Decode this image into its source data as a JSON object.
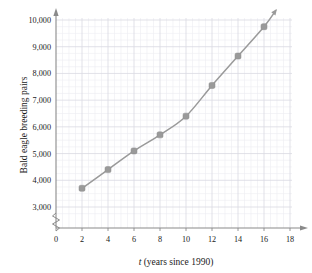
{
  "chart_data": {
    "type": "line",
    "title": "",
    "xlabel": "t (years since 1990)",
    "xlabel_italic_part": "t",
    "xlabel_rest": " (years since 1990)",
    "ylabel": "Bald eagle breeding pairs",
    "x": [
      2,
      4,
      6,
      8,
      10,
      12,
      14,
      16
    ],
    "values": [
      3700,
      4400,
      5100,
      5700,
      6400,
      7550,
      8650,
      9750
    ],
    "xlim": [
      0,
      18
    ],
    "ylim": [
      2600,
      10250
    ],
    "xticks": [
      0,
      2,
      4,
      6,
      8,
      10,
      12,
      14,
      16,
      18
    ],
    "xtick_labels": [
      "0",
      "2",
      "4",
      "6",
      "8",
      "10",
      "12",
      "14",
      "16",
      "18"
    ],
    "yticks": [
      3000,
      4000,
      5000,
      6000,
      7000,
      8000,
      9000,
      10000
    ],
    "ytick_labels": [
      "3,000",
      "4,000",
      "5,000",
      "6,000",
      "7,000",
      "8,000",
      "9,000",
      "10,000"
    ],
    "grid": true,
    "grid_minor": true,
    "y_axis_break": true,
    "legend": "none",
    "series_color": "#9a9a9a",
    "marker": "square-rounded",
    "marker_color": "#9a9a9a",
    "arrow_end": true,
    "axis_arrow_x": true,
    "axis_arrow_y": true
  },
  "colors": {
    "grid_major": "#d9d9e2",
    "grid_minor": "#ececf2",
    "axis": "#8a8a8a",
    "text": "#1a1a1a",
    "series": "#9a9a9a",
    "background": "#ffffff"
  },
  "labels": {
    "y_axis_title": "Bald eagle breeding pairs",
    "x_axis_title_italic": "t",
    "x_axis_title_rest": " (years since 1990)"
  }
}
